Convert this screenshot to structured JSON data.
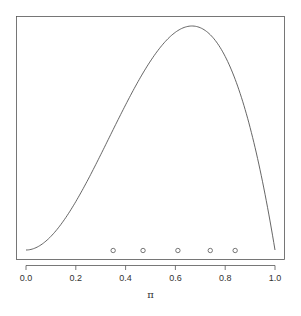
{
  "chart_data": {
    "type": "line",
    "title": "",
    "xlabel": "π",
    "ylabel": "",
    "xlim": [
      0,
      1
    ],
    "x_ticks": [
      0.0,
      0.2,
      0.4,
      0.6,
      0.8,
      1.0
    ],
    "x_tick_labels": [
      "0.0",
      "0.2",
      "0.4",
      "0.6",
      "0.8",
      "1.0"
    ],
    "y_ticks": [],
    "grid": false,
    "legend": null,
    "series": [
      {
        "name": "density curve",
        "style": "line",
        "description": "unimodal density, approx Beta(3,2), mode ≈ 0.65",
        "x": [
          0.0,
          0.1,
          0.2,
          0.3,
          0.4,
          0.5,
          0.6,
          0.65,
          0.7,
          0.8,
          0.9,
          1.0
        ],
        "y": [
          0.0,
          0.108,
          0.384,
          0.756,
          1.152,
          1.5,
          1.728,
          1.775,
          1.764,
          1.536,
          0.972,
          0.0
        ]
      },
      {
        "name": "observations",
        "style": "points",
        "marker": "open-circle",
        "x": [
          0.35,
          0.47,
          0.61,
          0.74,
          0.84
        ],
        "y": [
          0,
          0,
          0,
          0,
          0
        ]
      }
    ]
  },
  "axis": {
    "x_title": "π",
    "x_tick_labels": [
      "0.0",
      "0.2",
      "0.4",
      "0.6",
      "0.8",
      "1.0"
    ]
  }
}
